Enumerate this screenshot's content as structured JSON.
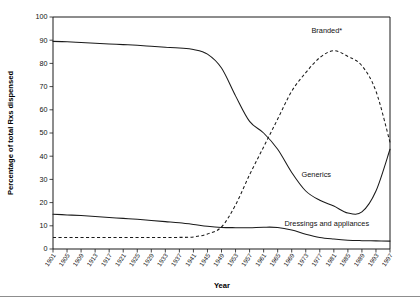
{
  "chart_data": {
    "type": "line",
    "title": "",
    "xlabel": "Year",
    "ylabel": "Percentage of total Rxs dispensed",
    "xlim": [
      1901,
      1997
    ],
    "ylim": [
      0,
      100
    ],
    "grid": false,
    "legend": "inline-annotations",
    "ytick_labels": [
      "0",
      "10",
      "20",
      "30",
      "40",
      "50",
      "60",
      "70",
      "80",
      "90",
      "100"
    ],
    "yticks": [
      0,
      10,
      20,
      30,
      40,
      50,
      60,
      70,
      80,
      90,
      100
    ],
    "xtick_labels": [
      "1901",
      "1905",
      "1909",
      "1913",
      "1917",
      "1921",
      "1925",
      "1929",
      "1933",
      "1937",
      "1941",
      "1945",
      "1949",
      "1953",
      "1957",
      "1961",
      "1965",
      "1969",
      "1973",
      "1977",
      "1981",
      "1985",
      "1989",
      "1993",
      "1997"
    ],
    "xticks": [
      1901,
      1905,
      1909,
      1913,
      1917,
      1921,
      1925,
      1929,
      1933,
      1937,
      1941,
      1945,
      1949,
      1953,
      1957,
      1961,
      1965,
      1969,
      1973,
      1977,
      1981,
      1985,
      1989,
      1993,
      1997
    ],
    "x": [
      1901,
      1905,
      1909,
      1913,
      1917,
      1921,
      1925,
      1929,
      1933,
      1937,
      1941,
      1945,
      1949,
      1953,
      1957,
      1961,
      1965,
      1969,
      1973,
      1977,
      1981,
      1985,
      1989,
      1993,
      1997
    ],
    "series": [
      {
        "name": "Generics",
        "style": "solid",
        "label": "Generics",
        "values": [
          89.5,
          89.3,
          89.0,
          88.7,
          88.4,
          88.1,
          87.8,
          87.4,
          87.0,
          86.6,
          86.0,
          84.0,
          78.0,
          66.0,
          55.0,
          50.0,
          43.0,
          33.0,
          25.0,
          21.0,
          18.5,
          15.5,
          16.0,
          25.0,
          43.0
        ]
      },
      {
        "name": "Branded*",
        "style": "dashed",
        "label": "Branded*",
        "values": [
          5.0,
          5.0,
          5.0,
          5.0,
          5.0,
          5.0,
          5.0,
          5.0,
          5.0,
          5.0,
          5.2,
          6.5,
          9.5,
          19.0,
          32.0,
          44.0,
          56.0,
          68.0,
          76.0,
          82.5,
          85.5,
          83.0,
          79.0,
          68.0,
          46.0
        ]
      },
      {
        "name": "Dressings and appliances",
        "style": "solid",
        "label": "Dressings and appliances",
        "values": [
          15.0,
          14.7,
          14.4,
          14.0,
          13.6,
          13.2,
          12.8,
          12.3,
          11.8,
          11.3,
          10.6,
          9.8,
          9.3,
          9.2,
          9.2,
          9.4,
          9.3,
          8.2,
          6.4,
          5.0,
          4.3,
          3.8,
          3.6,
          3.5,
          3.4
        ]
      }
    ],
    "annotations": [
      {
        "text": "Branded*",
        "x": 1979,
        "y": 93
      },
      {
        "text": "Generics",
        "x": 1976,
        "y": 31
      },
      {
        "text": "Dressings and appliances",
        "x": 1979,
        "y": 10
      }
    ]
  }
}
